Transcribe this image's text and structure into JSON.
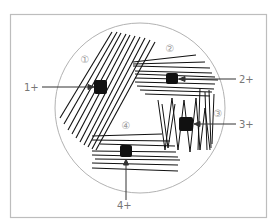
{
  "diagram": {
    "type": "streak-plate-quadrant",
    "colors": {
      "frame": "#bdbdbd",
      "plate": "#a9a9a9",
      "streak": "#111111",
      "label": "#777777",
      "quadrant_label": "#999999"
    },
    "quadrants": [
      {
        "id": "q1",
        "label": "①"
      },
      {
        "id": "q2",
        "label": "②"
      },
      {
        "id": "q3",
        "label": "③"
      },
      {
        "id": "q4",
        "label": "④"
      }
    ],
    "growth_labels": [
      {
        "id": "g1",
        "text": "1+"
      },
      {
        "id": "g2",
        "text": "2+"
      },
      {
        "id": "g3",
        "text": "3+"
      },
      {
        "id": "g4",
        "text": "4+"
      }
    ]
  }
}
